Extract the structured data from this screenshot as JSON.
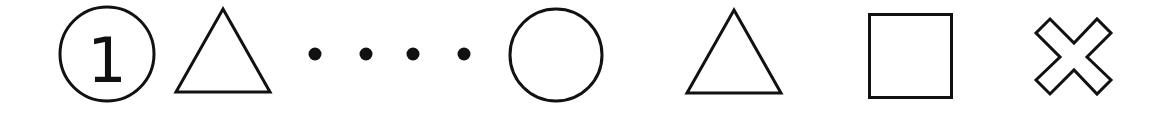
{
  "sequence": {
    "items": [
      {
        "type": "circled-number",
        "label": "1"
      },
      {
        "type": "triangle"
      },
      {
        "type": "dot"
      },
      {
        "type": "dot"
      },
      {
        "type": "dot"
      },
      {
        "type": "dot"
      },
      {
        "type": "circle"
      },
      {
        "type": "triangle"
      },
      {
        "type": "square"
      },
      {
        "type": "cross"
      }
    ]
  },
  "colors": {
    "stroke": "#111111",
    "background": "#ffffff"
  }
}
